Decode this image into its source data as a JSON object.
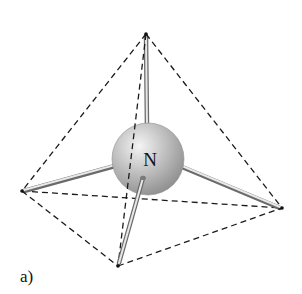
{
  "figure": {
    "panel_label": "a)",
    "central_atom": {
      "symbol": "N",
      "center": [
        148,
        159
      ],
      "radius": 36,
      "color": "#b5b5b5"
    },
    "geometry": "tetrahedral",
    "vertices": {
      "top": [
        146,
        34
      ],
      "left": [
        22,
        191
      ],
      "right": [
        282,
        208
      ],
      "bottom": [
        118,
        266
      ]
    },
    "edges": [
      [
        "top",
        "left"
      ],
      [
        "top",
        "right"
      ],
      [
        "top",
        "bottom"
      ],
      [
        "left",
        "right"
      ],
      [
        "left",
        "bottom"
      ],
      [
        "bottom",
        "right"
      ]
    ],
    "bonds": [
      "top",
      "left",
      "right",
      "bottom"
    ]
  }
}
